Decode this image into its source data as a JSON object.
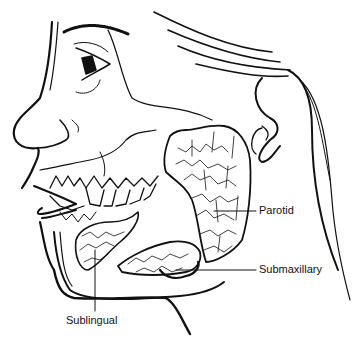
{
  "diagram": {
    "labels": {
      "parotid": "Parotid",
      "submaxillary": "Submaxillary",
      "sublingual": "Sublingual"
    },
    "colors": {
      "line": "#111111",
      "background": "#ffffff"
    }
  }
}
